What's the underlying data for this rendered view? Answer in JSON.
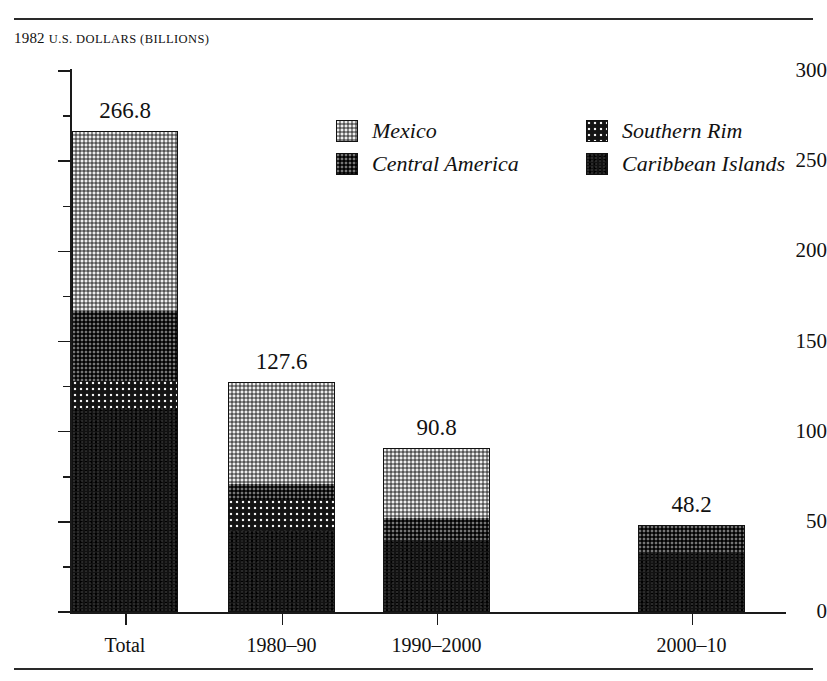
{
  "figure": {
    "axis_header_lead": "1982",
    "axis_header_rest": "U.S. DOLLARS (BILLIONS)"
  },
  "legend": {
    "entries": [
      {
        "label": "Mexico",
        "pattern": "mexico",
        "color": "#8e8e8e"
      },
      {
        "label": "Central America",
        "pattern": "central",
        "color": "#1f1f1f"
      },
      {
        "label": "Southern Rim",
        "pattern": "southern",
        "color": "#141414"
      },
      {
        "label": "Caribbean Islands",
        "pattern": "caribbean",
        "color": "#121212"
      }
    ]
  },
  "chart_data": {
    "type": "bar",
    "subtype": "stacked",
    "title": "",
    "xlabel": "",
    "ylabel": "1982 U.S. DOLLARS (BILLIONS)",
    "ylim": [
      0,
      300
    ],
    "yticks": [
      0,
      50,
      100,
      150,
      200,
      250,
      300
    ],
    "yticks_minor": [
      25,
      75,
      125,
      175,
      225,
      275
    ],
    "grid": false,
    "legend_position": "upper-center",
    "categories": [
      "Total",
      "1980–90",
      "1990–2000",
      "2000–10"
    ],
    "totals": [
      266.8,
      127.6,
      90.8,
      48.2
    ],
    "series": [
      {
        "name": "Mexico",
        "values": [
          100.0,
          56.6,
          38.8,
          0.0
        ]
      },
      {
        "name": "Central America",
        "values": [
          38.8,
          9.0,
          12.0,
          15.2
        ]
      },
      {
        "name": "Southern Rim",
        "values": [
          15.0,
          17.0,
          0.0,
          0.0
        ]
      },
      {
        "name": "Caribbean Islands",
        "values": [
          113.0,
          45.0,
          40.0,
          33.0
        ]
      }
    ],
    "bar_labels": [
      "266.8",
      "127.6",
      "90.8",
      "48.2"
    ]
  }
}
